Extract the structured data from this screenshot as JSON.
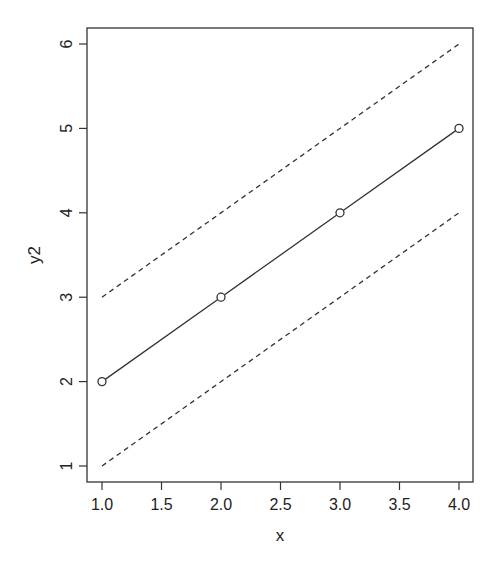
{
  "chart_data": {
    "type": "line",
    "title": "",
    "xlabel": "x",
    "ylabel": "y2",
    "xlim": [
      0.875,
      4.125
    ],
    "ylim": [
      0.82,
      6.19
    ],
    "grid": false,
    "legend": null,
    "x_ticks": [
      1.0,
      1.5,
      2.0,
      2.5,
      3.0,
      3.5,
      4.0
    ],
    "x_tick_labels": [
      "1.0",
      "1.5",
      "2.0",
      "2.5",
      "3.0",
      "3.5",
      "4.0"
    ],
    "y_ticks": [
      1,
      2,
      3,
      4,
      5,
      6
    ],
    "y_tick_labels": [
      "1",
      "2",
      "3",
      "4",
      "5",
      "6"
    ],
    "series": [
      {
        "name": "y2",
        "style": "solid-with-open-circles",
        "x": [
          1,
          2,
          3,
          4
        ],
        "values": [
          2,
          3,
          4,
          5
        ]
      },
      {
        "name": "upper",
        "style": "dashed",
        "x": [
          1,
          4
        ],
        "values": [
          3,
          6
        ]
      },
      {
        "name": "lower",
        "style": "dashed",
        "x": [
          1,
          4
        ],
        "values": [
          1,
          4
        ]
      }
    ],
    "colors": {
      "line": "#333333",
      "axis": "#333333",
      "text": "#222222"
    }
  }
}
